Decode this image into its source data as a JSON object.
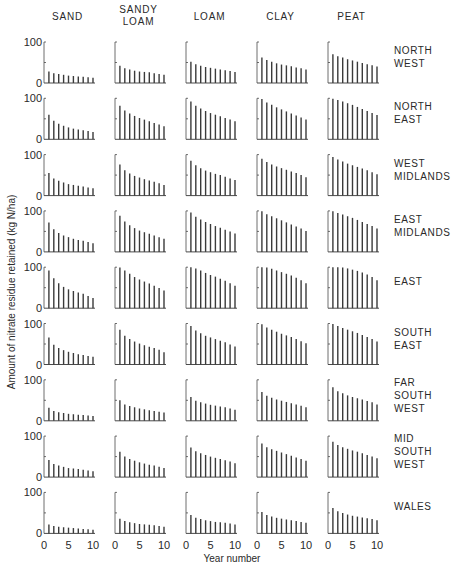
{
  "chart_data": {
    "type": "bar",
    "layout": "small-multiples grid",
    "title": "",
    "xlabel": "Year number",
    "ylabel": "Amount of nitrate residue retained (kg N/ha)",
    "ylim": [
      0,
      100
    ],
    "xlim": [
      0,
      10
    ],
    "x_ticks": [
      "0",
      "5",
      "10"
    ],
    "y_ticks": [
      "0",
      "100"
    ],
    "x": [
      1,
      2,
      3,
      4,
      5,
      6,
      7,
      8,
      9,
      10
    ],
    "columns": [
      {
        "name": "SAND",
        "label_lines": [
          "SAND"
        ]
      },
      {
        "name": "SANDY LOAM",
        "label_lines": [
          "SANDY",
          "LOAM"
        ]
      },
      {
        "name": "LOAM",
        "label_lines": [
          "LOAM"
        ]
      },
      {
        "name": "CLAY",
        "label_lines": [
          "CLAY"
        ]
      },
      {
        "name": "PEAT",
        "label_lines": [
          "PEAT"
        ]
      }
    ],
    "rows": [
      {
        "name": "NORTH WEST",
        "label_lines": [
          "NORTH",
          "WEST"
        ],
        "series": [
          [
            28,
            24,
            22,
            20,
            18,
            17,
            16,
            15,
            14,
            13
          ],
          [
            42,
            36,
            33,
            30,
            28,
            27,
            26,
            24,
            22,
            20
          ],
          [
            52,
            46,
            42,
            39,
            37,
            35,
            33,
            31,
            29,
            27
          ],
          [
            62,
            56,
            52,
            48,
            45,
            43,
            41,
            38,
            36,
            33
          ],
          [
            70,
            65,
            62,
            58,
            55,
            52,
            49,
            46,
            43,
            40
          ]
        ]
      },
      {
        "name": "NORTH EAST",
        "label_lines": [
          "NORTH",
          "EAST"
        ],
        "series": [
          [
            60,
            45,
            38,
            33,
            29,
            26,
            24,
            22,
            20,
            18
          ],
          [
            82,
            70,
            63,
            57,
            52,
            48,
            44,
            40,
            36,
            32
          ],
          [
            92,
            82,
            75,
            69,
            64,
            60,
            56,
            52,
            48,
            44
          ],
          [
            98,
            90,
            84,
            78,
            73,
            68,
            63,
            58,
            53,
            48
          ],
          [
            99,
            96,
            92,
            88,
            84,
            79,
            74,
            69,
            64,
            59
          ]
        ]
      },
      {
        "name": "WEST MIDLANDS",
        "label_lines": [
          "WEST",
          "MIDLANDS"
        ],
        "series": [
          [
            55,
            42,
            36,
            32,
            28,
            26,
            24,
            22,
            20,
            18
          ],
          [
            76,
            62,
            54,
            48,
            44,
            40,
            37,
            34,
            30,
            26
          ],
          [
            85,
            74,
            67,
            61,
            57,
            53,
            50,
            46,
            42,
            38
          ],
          [
            90,
            82,
            76,
            71,
            67,
            63,
            59,
            55,
            50,
            45
          ],
          [
            94,
            88,
            83,
            78,
            74,
            70,
            66,
            62,
            57,
            52
          ]
        ]
      },
      {
        "name": "EAST MIDLANDS",
        "label_lines": [
          "EAST",
          "MIDLANDS"
        ],
        "series": [
          [
            72,
            55,
            46,
            40,
            36,
            32,
            29,
            27,
            24,
            21
          ],
          [
            88,
            74,
            65,
            58,
            52,
            48,
            44,
            40,
            36,
            32
          ],
          [
            96,
            86,
            79,
            73,
            68,
            63,
            59,
            54,
            50,
            45
          ],
          [
            99,
            92,
            87,
            82,
            77,
            72,
            67,
            62,
            57,
            51
          ],
          [
            99,
            95,
            91,
            87,
            83,
            78,
            73,
            68,
            63,
            57
          ]
        ]
      },
      {
        "name": "EAST",
        "label_lines": [
          "EAST"
        ],
        "series": [
          [
            92,
            73,
            61,
            52,
            46,
            42,
            38,
            35,
            30,
            25
          ],
          [
            99,
            92,
            84,
            76,
            70,
            65,
            60,
            55,
            49,
            43
          ],
          [
            100,
            97,
            92,
            86,
            81,
            77,
            72,
            67,
            61,
            55
          ],
          [
            100,
            99,
            96,
            92,
            88,
            84,
            80,
            74,
            68,
            61
          ],
          [
            100,
            100,
            99,
            97,
            94,
            91,
            87,
            82,
            76,
            68
          ]
        ]
      },
      {
        "name": "SOUTH EAST",
        "label_lines": [
          "SOUTH",
          "EAST"
        ],
        "series": [
          [
            66,
            48,
            40,
            35,
            31,
            28,
            25,
            23,
            21,
            19
          ],
          [
            85,
            70,
            62,
            56,
            51,
            47,
            43,
            40,
            36,
            30
          ],
          [
            94,
            83,
            76,
            70,
            66,
            62,
            58,
            54,
            49,
            44
          ],
          [
            98,
            90,
            85,
            80,
            75,
            71,
            67,
            62,
            57,
            52
          ],
          [
            99,
            94,
            89,
            85,
            81,
            77,
            72,
            67,
            62,
            56
          ]
        ]
      },
      {
        "name": "FAR SOUTH WEST",
        "label_lines": [
          "FAR",
          "SOUTH",
          "WEST"
        ],
        "series": [
          [
            32,
            24,
            21,
            19,
            17,
            16,
            15,
            14,
            13,
            12
          ],
          [
            50,
            40,
            36,
            33,
            30,
            28,
            26,
            24,
            22,
            20
          ],
          [
            58,
            49,
            45,
            42,
            39,
            37,
            35,
            33,
            30,
            27
          ],
          [
            70,
            61,
            56,
            52,
            49,
            46,
            43,
            40,
            37,
            33
          ],
          [
            82,
            72,
            67,
            62,
            58,
            55,
            52,
            48,
            45,
            40
          ]
        ]
      },
      {
        "name": "MID SOUTH WEST",
        "label_lines": [
          "MID",
          "SOUTH",
          "WEST"
        ],
        "series": [
          [
            42,
            32,
            28,
            25,
            22,
            21,
            20,
            18,
            16,
            14
          ],
          [
            62,
            50,
            44,
            40,
            36,
            33,
            30,
            28,
            25,
            22
          ],
          [
            72,
            63,
            58,
            54,
            50,
            47,
            44,
            41,
            38,
            34
          ],
          [
            82,
            73,
            68,
            64,
            60,
            56,
            52,
            48,
            44,
            40
          ],
          [
            86,
            78,
            73,
            69,
            65,
            62,
            58,
            54,
            50,
            46
          ]
        ]
      },
      {
        "name": "WALES",
        "label_lines": [
          "WALES"
        ],
        "series": [
          [
            22,
            18,
            16,
            15,
            14,
            13,
            12,
            11,
            10,
            9
          ],
          [
            36,
            30,
            27,
            25,
            23,
            22,
            21,
            20,
            18,
            16
          ],
          [
            45,
            38,
            35,
            32,
            30,
            28,
            27,
            26,
            24,
            22
          ],
          [
            52,
            45,
            41,
            38,
            36,
            34,
            32,
            30,
            28,
            26
          ],
          [
            62,
            54,
            50,
            46,
            43,
            41,
            39,
            37,
            35,
            32
          ]
        ]
      }
    ],
    "grid": false,
    "legend": "none"
  },
  "colors": {
    "bar": "#3a3a3a",
    "axis": "#4a4a4a",
    "text": "#2a2a2a"
  }
}
